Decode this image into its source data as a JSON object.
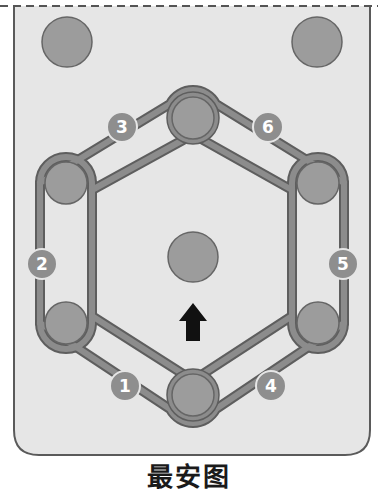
{
  "diagram": {
    "caption": "最安图",
    "colors": {
      "panel_fill": "#e6e6e6",
      "panel_border": "#5a5a5a",
      "belt": "#8c8c8c",
      "belt_edge": "#5e5e5e",
      "pulley_fill": "#9c9c9c",
      "pulley_edge": "#666666",
      "badge_fill": "#8e8e8e",
      "badge_text": "#ffffff",
      "arrow": "#111111"
    },
    "pulleys": [
      {
        "id": "top-left-fixed",
        "x": 67,
        "y": 42,
        "r": 25
      },
      {
        "id": "top-right-fixed",
        "x": 317,
        "y": 42,
        "r": 25
      },
      {
        "id": "center",
        "x": 193,
        "y": 257,
        "r": 25
      },
      {
        "id": "hex-top",
        "x": 193,
        "y": 118,
        "r": 22
      },
      {
        "id": "hex-upper-left",
        "x": 66,
        "y": 183,
        "r": 22
      },
      {
        "id": "hex-upper-right",
        "x": 318,
        "y": 183,
        "r": 22
      },
      {
        "id": "hex-lower-left",
        "x": 66,
        "y": 323,
        "r": 22
      },
      {
        "id": "hex-lower-right",
        "x": 318,
        "y": 323,
        "r": 22
      },
      {
        "id": "hex-bottom",
        "x": 193,
        "y": 395,
        "r": 22
      }
    ],
    "badges": [
      {
        "label": "1",
        "x": 125,
        "y": 386
      },
      {
        "label": "2",
        "x": 42,
        "y": 264
      },
      {
        "label": "3",
        "x": 122,
        "y": 127
      },
      {
        "label": "4",
        "x": 271,
        "y": 386
      },
      {
        "label": "5",
        "x": 343,
        "y": 264
      },
      {
        "label": "6",
        "x": 268,
        "y": 127
      }
    ],
    "arrow": {
      "direction": "up",
      "x": 193,
      "y": 325
    }
  }
}
